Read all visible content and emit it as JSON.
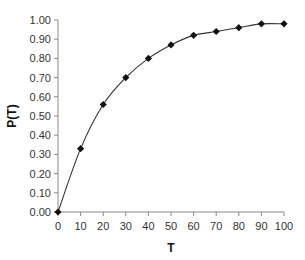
{
  "chart_data": {
    "type": "line",
    "title": "",
    "xlabel": "T",
    "ylabel": "P(T)",
    "x": [
      0,
      10,
      20,
      30,
      40,
      50,
      60,
      70,
      80,
      90,
      100
    ],
    "series": [
      {
        "name": "P(T)",
        "values": [
          0.0,
          0.33,
          0.56,
          0.7,
          0.8,
          0.87,
          0.92,
          0.94,
          0.96,
          0.98,
          0.98
        ],
        "marker": "diamond",
        "line": "smooth",
        "color": "#111111"
      }
    ],
    "xlim": [
      0,
      100
    ],
    "ylim": [
      0,
      1.0
    ],
    "xticks": [
      "0",
      "10",
      "20",
      "30",
      "40",
      "50",
      "60",
      "70",
      "80",
      "90",
      "100"
    ],
    "yticks": [
      "0.00",
      "0.10",
      "0.20",
      "0.30",
      "0.40",
      "0.50",
      "0.60",
      "0.70",
      "0.80",
      "0.90",
      "1.00"
    ],
    "grid": false,
    "legend": null
  },
  "colors": {
    "axis": "#888888",
    "line": "#333333",
    "marker": "#111111"
  }
}
